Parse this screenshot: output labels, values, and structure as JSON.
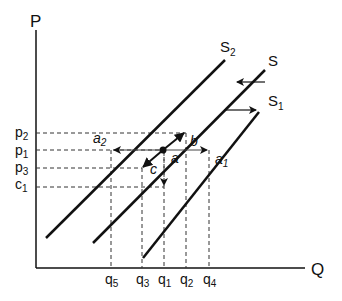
{
  "axes": {
    "y_label": "P",
    "x_label": "Q"
  },
  "curves": [
    {
      "id": "S2",
      "label": "S",
      "sub": "2"
    },
    {
      "id": "S",
      "label": "S",
      "sub": ""
    },
    {
      "id": "S1",
      "label": "S",
      "sub": "1"
    }
  ],
  "price_ticks": [
    {
      "label": "p",
      "sub": "2"
    },
    {
      "label": "p",
      "sub": "1"
    },
    {
      "label": "p",
      "sub": "3"
    },
    {
      "label": "c",
      "sub": "1"
    }
  ],
  "quantity_ticks": [
    {
      "label": "q",
      "sub": "5"
    },
    {
      "label": "q",
      "sub": "3"
    },
    {
      "label": "q",
      "sub": "1"
    },
    {
      "label": "q",
      "sub": "2"
    },
    {
      "label": "q",
      "sub": "4"
    }
  ],
  "points": [
    {
      "label": "a",
      "sub": ""
    },
    {
      "label": "a",
      "sub": "1"
    },
    {
      "label": "a",
      "sub": "2"
    },
    {
      "label": "b",
      "sub": ""
    },
    {
      "label": "c",
      "sub": ""
    }
  ]
}
